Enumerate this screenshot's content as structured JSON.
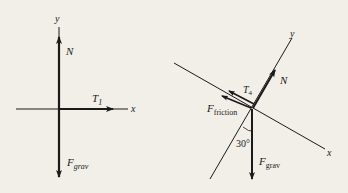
{
  "left_diagram": {
    "axis_x_label": "x",
    "axis_y_label": "y",
    "forces": {
      "normal": {
        "main": "N"
      },
      "tension": {
        "main": "T",
        "sub": "1"
      },
      "gravity": {
        "main": "F",
        "sub": "grav"
      }
    }
  },
  "right_diagram": {
    "axis_x_label": "x",
    "axis_y_label": "y",
    "angle_label": "30°",
    "forces": {
      "normal": {
        "main": "N"
      },
      "tension": {
        "main": "T",
        "sub": "4"
      },
      "friction": {
        "main": "F",
        "sub": "friction"
      },
      "gravity": {
        "main": "F",
        "sub": "grav"
      }
    }
  },
  "colors": {
    "background": "#f1efe8",
    "ink": "#1a1a1a"
  }
}
